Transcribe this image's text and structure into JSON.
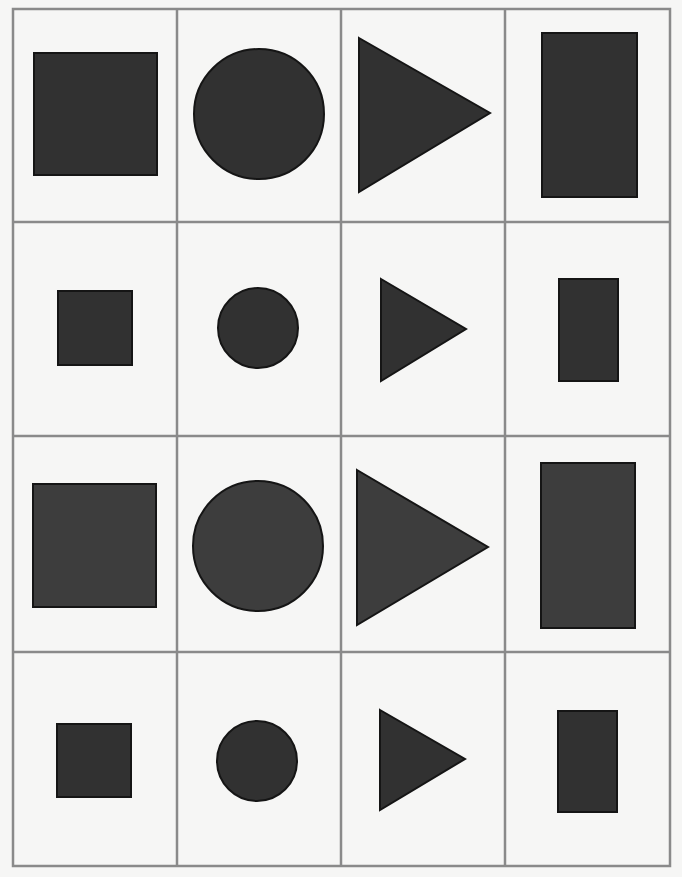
{
  "figure": {
    "width": 682,
    "height": 877,
    "background": "#f6f6f5",
    "grid": {
      "rows": 4,
      "cols": 4,
      "line_color": "#8a8a8a",
      "line_width": 2.5,
      "outer": {
        "x1": 13,
        "y1": 9,
        "x2": 670,
        "y2": 866
      },
      "col_lines": [
        177,
        341,
        505
      ],
      "row_lines": [
        222,
        436,
        652
      ]
    },
    "style": {
      "fill": "#313131",
      "fill_alt": "#3d3d3d",
      "stroke": "#151515",
      "stroke_width": 2
    },
    "cells": [
      {
        "row": 1,
        "col": 1,
        "shape": "square",
        "size": "large",
        "x": 34,
        "y": 53,
        "w": 123,
        "h": 122
      },
      {
        "row": 1,
        "col": 2,
        "shape": "circle",
        "size": "large",
        "cx": 259,
        "cy": 114,
        "r": 65
      },
      {
        "row": 1,
        "col": 3,
        "shape": "triangle",
        "size": "large",
        "points": "359,38 490,113 359,192"
      },
      {
        "row": 1,
        "col": 4,
        "shape": "rectangle",
        "size": "large",
        "x": 542,
        "y": 33,
        "w": 95,
        "h": 164
      },
      {
        "row": 2,
        "col": 1,
        "shape": "square",
        "size": "small",
        "x": 58,
        "y": 291,
        "w": 74,
        "h": 74
      },
      {
        "row": 2,
        "col": 2,
        "shape": "circle",
        "size": "small",
        "cx": 258,
        "cy": 328,
        "r": 40
      },
      {
        "row": 2,
        "col": 3,
        "shape": "triangle",
        "size": "small",
        "points": "381,279 466,329 381,381"
      },
      {
        "row": 2,
        "col": 4,
        "shape": "rectangle",
        "size": "small",
        "x": 559,
        "y": 279,
        "w": 59,
        "h": 102
      },
      {
        "row": 3,
        "col": 1,
        "shape": "square",
        "size": "large",
        "x": 33,
        "y": 484,
        "w": 123,
        "h": 123
      },
      {
        "row": 3,
        "col": 2,
        "shape": "circle",
        "size": "large",
        "cx": 258,
        "cy": 546,
        "r": 65
      },
      {
        "row": 3,
        "col": 3,
        "shape": "triangle",
        "size": "large",
        "points": "357,470 488,547 357,625"
      },
      {
        "row": 3,
        "col": 4,
        "shape": "rectangle",
        "size": "large",
        "x": 541,
        "y": 463,
        "w": 94,
        "h": 165
      },
      {
        "row": 4,
        "col": 1,
        "shape": "square",
        "size": "small",
        "x": 57,
        "y": 724,
        "w": 74,
        "h": 73
      },
      {
        "row": 4,
        "col": 2,
        "shape": "circle",
        "size": "small",
        "cx": 257,
        "cy": 761,
        "r": 40
      },
      {
        "row": 4,
        "col": 3,
        "shape": "triangle",
        "size": "small",
        "points": "380,710 465,759 380,810"
      },
      {
        "row": 4,
        "col": 4,
        "shape": "rectangle",
        "size": "small",
        "x": 558,
        "y": 711,
        "w": 59,
        "h": 101
      }
    ]
  }
}
